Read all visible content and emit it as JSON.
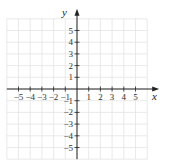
{
  "diagram": {
    "type": "coordinate-plane",
    "x_axis_label": "x",
    "y_axis_label": "y",
    "x_range": [
      -6,
      6
    ],
    "y_range": [
      -6,
      6
    ],
    "x_tick_labels": [
      "−5",
      "−4",
      "−3",
      "−2",
      "−1",
      "1",
      "2",
      "3",
      "4",
      "5"
    ],
    "x_tick_values": [
      -5,
      -4,
      -3,
      -2,
      -1,
      1,
      2,
      3,
      4,
      5
    ],
    "y_tick_labels": [
      "5",
      "4",
      "3",
      "2",
      "1",
      "−1",
      "−2",
      "−3",
      "−4",
      "−5"
    ],
    "y_tick_values": [
      5,
      4,
      3,
      2,
      1,
      -1,
      -2,
      -3,
      -4,
      -5
    ],
    "grid": true,
    "colors": {
      "grid": "#e4e4e4",
      "axis": "#222222",
      "label": "#333333"
    }
  }
}
